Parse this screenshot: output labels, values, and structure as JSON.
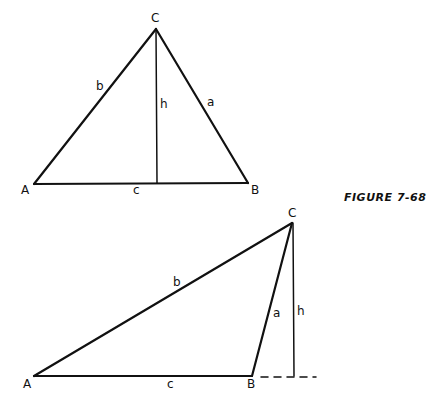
{
  "figure": {
    "caption": "FIGURE 7-68"
  },
  "top_triangle": {
    "vertices": {
      "A": "A",
      "B": "B",
      "C": "C"
    },
    "sides": {
      "a": "a",
      "b": "b",
      "c": "c"
    },
    "height": "h",
    "type": "acute triangle with altitude inside"
  },
  "bottom_triangle": {
    "vertices": {
      "A": "A",
      "B": "B",
      "C": "C"
    },
    "sides": {
      "a": "a",
      "b": "b",
      "c": "c"
    },
    "height": "h",
    "type": "obtuse triangle with altitude outside (base extended, dashed)"
  },
  "colors": {
    "line": "#111111",
    "background": "#ffffff"
  }
}
